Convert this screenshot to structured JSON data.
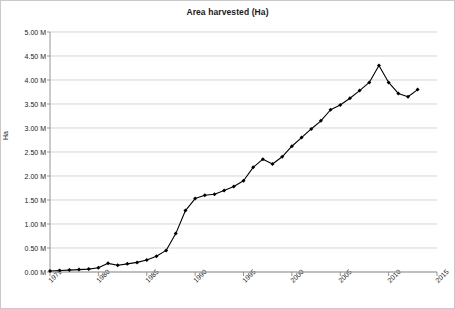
{
  "chart_data": {
    "type": "line",
    "title": "Area harvested (Ha)",
    "xlabel": "",
    "ylabel": "Ha",
    "grid": true,
    "legend": "none",
    "xlim": [
      1975,
      2015
    ],
    "ylim": [
      0,
      5000000
    ],
    "y_tick_labels": [
      "5.00 M",
      "4.50 M",
      "4.00 M",
      "3.50 M",
      "3.00 M",
      "2.50 M",
      "2.00 M",
      "1.50 M",
      "1.00 M",
      "0.50 M",
      "0.00 M"
    ],
    "y_tick_values": [
      5000000,
      4500000,
      4000000,
      3500000,
      3000000,
      2500000,
      2000000,
      1500000,
      1000000,
      500000,
      0
    ],
    "x_tick_labels": [
      "1975",
      "1980",
      "1985",
      "1990",
      "1995",
      "2000",
      "2005",
      "2010",
      "2015"
    ],
    "x_tick_values": [
      1975,
      1980,
      1985,
      1990,
      1995,
      2000,
      2005,
      2010,
      2015
    ],
    "series_name": "Area harvested",
    "series_color": "#000000",
    "marker": "diamond",
    "x": [
      1975,
      1976,
      1977,
      1978,
      1979,
      1980,
      1981,
      1982,
      1983,
      1984,
      1985,
      1986,
      1987,
      1988,
      1989,
      1990,
      1991,
      1992,
      1993,
      1994,
      1995,
      1996,
      1997,
      1998,
      1999,
      2000,
      2001,
      2002,
      2003,
      2004,
      2005,
      2006,
      2007,
      2008,
      2009,
      2010,
      2011,
      2012,
      2013
    ],
    "values": [
      20000,
      30000,
      40000,
      50000,
      60000,
      90000,
      180000,
      140000,
      170000,
      200000,
      250000,
      330000,
      450000,
      800000,
      1280000,
      1530000,
      1600000,
      1620000,
      1700000,
      1780000,
      1900000,
      2180000,
      2350000,
      2250000,
      2400000,
      2620000,
      2800000,
      2980000,
      3150000,
      3380000,
      3480000,
      3620000,
      3780000,
      3950000,
      4300000,
      3950000,
      3720000,
      3650000,
      3800000
    ]
  }
}
